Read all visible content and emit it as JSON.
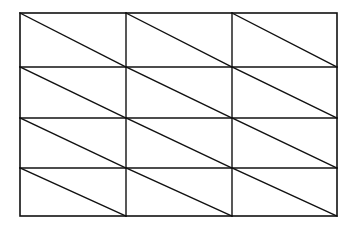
{
  "figure": {
    "background_color": "#ffffff",
    "line_color": "#111111",
    "canvas": {
      "width": 356,
      "height": 231
    },
    "outer_rect": {
      "x": 20,
      "y": 13,
      "width": 317,
      "height": 203,
      "stroke_width": 1.6
    },
    "grid": {
      "columns": 3,
      "rows": 4,
      "cell_count": 12,
      "triangle_count": 24,
      "column_edges_x": [
        20,
        126,
        232,
        337
      ],
      "row_edges_y": [
        13,
        67,
        118,
        168,
        216
      ],
      "interior_vertical_x": [
        126,
        232
      ],
      "interior_horizontal_y": [
        67,
        118,
        168
      ],
      "grid_stroke_width": 1.4,
      "diagonal_stroke_width": 1.4,
      "diagonal_direction": "top-left-to-bottom-right"
    },
    "cells": [
      {
        "row": 0,
        "col": 0,
        "x": 20,
        "y": 13,
        "width": 106,
        "height": 54
      },
      {
        "row": 0,
        "col": 1,
        "x": 126,
        "y": 13,
        "width": 106,
        "height": 54
      },
      {
        "row": 0,
        "col": 2,
        "x": 232,
        "y": 13,
        "width": 105,
        "height": 54
      },
      {
        "row": 1,
        "col": 0,
        "x": 20,
        "y": 67,
        "width": 106,
        "height": 51
      },
      {
        "row": 1,
        "col": 1,
        "x": 126,
        "y": 67,
        "width": 106,
        "height": 51
      },
      {
        "row": 1,
        "col": 2,
        "x": 232,
        "y": 67,
        "width": 105,
        "height": 51
      },
      {
        "row": 2,
        "col": 0,
        "x": 20,
        "y": 118,
        "width": 106,
        "height": 50
      },
      {
        "row": 2,
        "col": 1,
        "x": 126,
        "y": 118,
        "width": 106,
        "height": 50
      },
      {
        "row": 2,
        "col": 2,
        "x": 232,
        "y": 118,
        "width": 105,
        "height": 50
      },
      {
        "row": 3,
        "col": 0,
        "x": 20,
        "y": 168,
        "width": 106,
        "height": 48
      },
      {
        "row": 3,
        "col": 1,
        "x": 126,
        "y": 168,
        "width": 106,
        "height": 48
      },
      {
        "row": 3,
        "col": 2,
        "x": 232,
        "y": 168,
        "width": 105,
        "height": 48
      }
    ],
    "labels": []
  }
}
